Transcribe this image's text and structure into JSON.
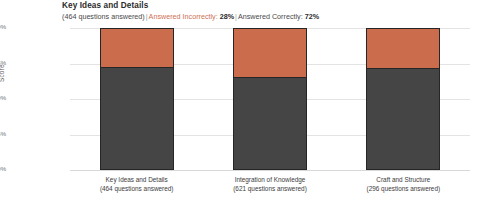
{
  "header": {
    "title": "Key Ideas and Details",
    "questions_answered": "(464 questions answered)",
    "separator": "|",
    "incorrect_label": "Answered Incorrectly:",
    "incorrect_pct": "28%",
    "correct_label": "Answered Correctly:",
    "correct_pct": "72%"
  },
  "chart_data": {
    "type": "bar",
    "stacked": true,
    "title": "Key Ideas and Details",
    "xlabel": "",
    "ylabel": "Score",
    "ylim": [
      0,
      100
    ],
    "ytick_labels": [
      "100%",
      "75%",
      "50%",
      "25%",
      "0%"
    ],
    "ytick_values": [
      100,
      75,
      50,
      25,
      0
    ],
    "grid": true,
    "legend_position": "none",
    "categories": [
      "Key Ideas and Details",
      "Integration of Knowledge",
      "Craft and Structure"
    ],
    "category_sublabels": [
      "(464 questions answered)",
      "(621 questions answered)",
      "(296 questions answered)"
    ],
    "series": [
      {
        "name": "Answered Correctly",
        "color": "#454545",
        "values": [
          72,
          65,
          71
        ]
      },
      {
        "name": "Answered Incorrectly",
        "color": "#cb6d4d",
        "values": [
          28,
          35,
          29
        ]
      }
    ]
  },
  "colors": {
    "correct": "#454545",
    "incorrect": "#cb6d4d",
    "gridline": "#e3e3e3",
    "background": "#ffffff",
    "incorrect_text": "#cf7154"
  }
}
